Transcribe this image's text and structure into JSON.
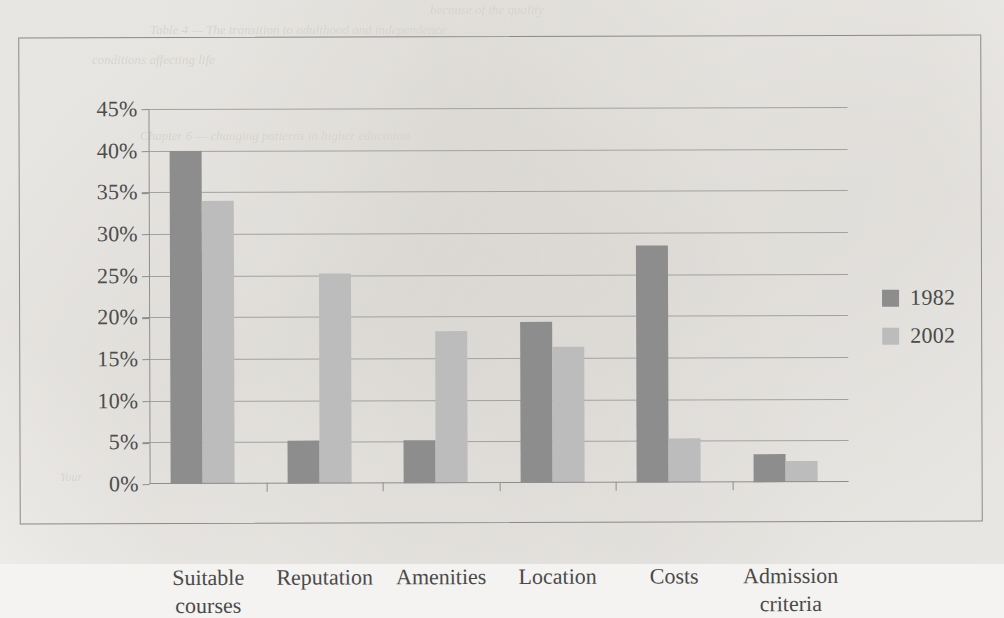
{
  "chart_data": {
    "type": "bar",
    "title": "",
    "subtitle": "",
    "xlabel": "",
    "ylabel": "",
    "categories": [
      "Suitable courses",
      "Reputation",
      "Amenities",
      "Location",
      "Costs",
      "Admission criteria"
    ],
    "series": [
      {
        "name": "1982",
        "color": "#8d8d8d",
        "values": [
          40.0,
          5.2,
          5.2,
          19.3,
          28.5,
          3.4
        ]
      },
      {
        "name": "2002",
        "color": "#bcbcbc",
        "values": [
          34.0,
          25.2,
          18.3,
          16.3,
          5.3,
          2.5
        ]
      }
    ],
    "ylim": [
      0,
      45
    ],
    "ytick_labels": [
      "45%",
      "40%",
      "35%",
      "30%",
      "25%",
      "20%",
      "15%",
      "10%",
      "5%",
      "0%"
    ],
    "ytick_values": [
      45,
      40,
      35,
      30,
      25,
      20,
      15,
      10,
      5,
      0
    ],
    "grid": true,
    "legend_position": "right",
    "value_suffix": "%"
  },
  "frame": {
    "border_color": "#8a8a8a",
    "axis_color": "#8e8e8e",
    "gridline_color": "#a2a2a2",
    "text_color": "#4a4a4a",
    "background": "#f4f3f1"
  },
  "bleed_through_text": {
    "line_1": "because of the quality",
    "line_2": "Table 4 — The transition to adulthood and independence",
    "line_3": "conditions affecting life",
    "line_4": "",
    "line_5": "Chapter 6 — changing patterns in higher education",
    "line_6": "",
    "line_7": "",
    "line_8": "",
    "line_9": "Your",
    "line_10": ""
  }
}
